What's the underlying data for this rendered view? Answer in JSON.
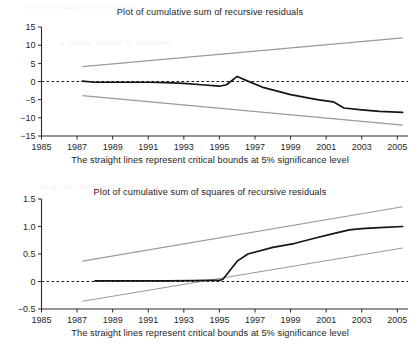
{
  "figure": {
    "background_color": "#ffffff",
    "ink_color": "#151515",
    "bound_color": "#9a9a9a"
  },
  "panels": [
    {
      "id": "cusum",
      "title": "Plot of cumulative sum of recursive residuals",
      "caption": "The straight lines represent critical bounds at 5% significance level"
    },
    {
      "id": "cusumsq",
      "title": "Plot of cumulative sum of squares of recursive residuals",
      "caption": "The straight lines represent critical bounds at 5% significance level"
    }
  ],
  "chart_data": [
    {
      "type": "line",
      "id": "cusum",
      "title": "Plot of cumulative sum of recursive residuals",
      "subtitle": "The straight lines represent critical bounds at 5% significance level",
      "xlabel": "",
      "ylabel": "",
      "xlim": [
        1985,
        2005.6
      ],
      "ylim": [
        -15,
        15
      ],
      "ytick_labels": [
        "15",
        "10",
        "5",
        "0",
        "−5",
        "−10",
        "−15"
      ],
      "yticks": [
        15,
        10,
        5,
        0,
        -5,
        -10,
        -15
      ],
      "xticks": [
        1985,
        1987,
        1989,
        1991,
        1993,
        1995,
        1997,
        1999,
        2001,
        2003,
        2005
      ],
      "xtick_labels": [
        "1985",
        "1987",
        "1989",
        "1991",
        "1993",
        "1995",
        "1997",
        "1999",
        "2001",
        "2003",
        "2005"
      ],
      "grid": false,
      "legend": "none",
      "zero_reference_line": 0,
      "series": [
        {
          "name": "CUSUM",
          "style": "solid-dark",
          "x": [
            1987.3,
            1988.0,
            1989.0,
            1990.0,
            1991.0,
            1992.0,
            1993.0,
            1994.0,
            1995.0,
            1995.4,
            1996.0,
            1996.6,
            1997.5,
            1999.0,
            2000.5,
            2001.4,
            2002.0,
            2003.0,
            2004.0,
            2005.3
          ],
          "values": [
            0.1,
            -0.2,
            -0.2,
            -0.2,
            -0.2,
            -0.3,
            -0.5,
            -0.9,
            -1.3,
            -0.9,
            1.4,
            0.1,
            -1.7,
            -3.6,
            -5.0,
            -5.6,
            -7.3,
            -7.8,
            -8.2,
            -8.5
          ]
        },
        {
          "name": "Upper 5% critical bound",
          "style": "solid-gray",
          "x": [
            1987.3,
            2005.3
          ],
          "values": [
            4.1,
            12.0
          ]
        },
        {
          "name": "Lower 5% critical bound",
          "style": "solid-gray",
          "x": [
            1987.3,
            2005.3
          ],
          "values": [
            -3.9,
            -12.0
          ]
        }
      ]
    },
    {
      "type": "line",
      "id": "cusumsq",
      "title": "Plot of cumulative sum of squares of recursive residuals",
      "subtitle": "The straight lines represent critical bounds at 5% significance level",
      "xlabel": "",
      "ylabel": "",
      "xlim": [
        1985,
        2005.6
      ],
      "ylim": [
        -0.5,
        1.5
      ],
      "ytick_labels": [
        "1.5",
        "1.0",
        "0.5",
        "0",
        "−0.5"
      ],
      "yticks": [
        1.5,
        1.0,
        0.5,
        0,
        -0.5
      ],
      "xticks": [
        1985,
        1987,
        1989,
        1991,
        1993,
        1995,
        1997,
        1999,
        2001,
        2003,
        2005
      ],
      "xtick_labels": [
        "1985",
        "1987",
        "1989",
        "1991",
        "1993",
        "1995",
        "1997",
        "1999",
        "2001",
        "2003",
        "2005"
      ],
      "grid": false,
      "legend": "none",
      "zero_reference_line": 0,
      "series": [
        {
          "name": "CUSUM of squares",
          "style": "solid-dark",
          "x": [
            1988.0,
            1990.0,
            1992.0,
            1993.5,
            1994.3,
            1995.0,
            1995.2,
            1996.0,
            1996.6,
            1998.0,
            1999.2,
            2000.4,
            2001.4,
            2002.3,
            2003.0,
            2004.0,
            2005.3
          ],
          "values": [
            0.01,
            0.01,
            0.01,
            0.015,
            0.02,
            0.02,
            0.04,
            0.37,
            0.5,
            0.62,
            0.69,
            0.79,
            0.87,
            0.94,
            0.96,
            0.98,
            1.0
          ]
        },
        {
          "name": "Upper 5% critical bound",
          "style": "solid-gray",
          "x": [
            1987.3,
            2005.3
          ],
          "values": [
            0.37,
            1.36
          ]
        },
        {
          "name": "Lower 5% critical bound",
          "style": "solid-gray",
          "x": [
            1987.3,
            2005.3
          ],
          "values": [
            -0.36,
            0.61
          ]
        }
      ]
    }
  ],
  "bleed_text": {
    "lines": [
      "of the variables in the model",
      "a similar pattern is observed",
      "long run coefficients are not"
    ]
  }
}
